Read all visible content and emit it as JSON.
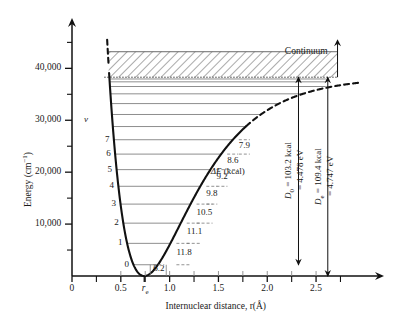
{
  "figure": {
    "type": "morse-potential-energy-curve",
    "background": "#ffffff",
    "curve_color": "#111111",
    "level_color": "#7a7a7a",
    "axis_color": "#111111"
  },
  "axes": {
    "y": {
      "label": "Energy (cm",
      "label_sup": "−1",
      "label_tail": ")",
      "major_ticks": [
        "10,000",
        "20,000",
        "30,000",
        "40,000"
      ],
      "major_values": [
        10000,
        20000,
        30000,
        40000
      ],
      "minor_values": [
        5000,
        15000,
        25000,
        35000,
        45000
      ],
      "min": 0,
      "max": 47000
    },
    "x": {
      "label_pre": "Internuclear distance, r(",
      "label_unit": "Å",
      "label_post": ")",
      "major_ticks": [
        "0",
        "0.5",
        "1.0",
        "1.5",
        "2.0",
        "2.5"
      ],
      "major_values": [
        0,
        0.5,
        1.0,
        1.5,
        2.0,
        2.5
      ],
      "minor_values": [
        0.25,
        0.75,
        1.25,
        1.75,
        2.25,
        2.75
      ],
      "min": 0,
      "max": 2.95,
      "re_label": "r",
      "re_sub": "e",
      "re_value": 0.74
    }
  },
  "annotations": {
    "continuum": "Continuum",
    "delta_e_header_sym": "ΔE",
    "delta_e_header_unit": " (kcal)",
    "v_column_header": "v",
    "d0": {
      "symbol": "D",
      "sub": "0",
      "line1": " = 103.2 kcal",
      "line2": "= 4.478 eV",
      "kcal": 103.2,
      "ev": 4.478,
      "x": 2.32
    },
    "de": {
      "symbol": "D",
      "sub": "e",
      "line1": " = 109.4 kcal",
      "line2": "= 4.747 eV",
      "kcal": 109.4,
      "ev": 4.747,
      "x": 2.62
    }
  },
  "chart_data": {
    "type": "line",
    "title": "",
    "xlabel": "Internuclear distance, r(Å)",
    "ylabel": "Energy (cm−1)",
    "xlim": [
      0,
      2.95
    ],
    "ylim": [
      0,
      47000
    ],
    "grid": false,
    "legend": "none",
    "potential": {
      "model": "morse",
      "De_cm": 38290,
      "re_angstrom": 0.74,
      "a": 1.94,
      "dissociation_limit_cm": 38290,
      "dashed_above_cm": 40500,
      "dashed_right_from_angstrom": 1.78
    },
    "continuum_band": {
      "y_bottom_cm": 38290,
      "y_top_cm": 43200,
      "hatched": true
    },
    "vibrational_levels": [
      {
        "v": "0",
        "energy_cm": 2165,
        "label": "0",
        "delta_e": "6.2"
      },
      {
        "v": "1",
        "energy_cm": 6290,
        "label": "1",
        "delta_e": "11.8"
      },
      {
        "v": "2",
        "energy_cm": 10180,
        "label": "2",
        "delta_e": "11.1"
      },
      {
        "v": "3",
        "energy_cm": 13850,
        "label": "3",
        "delta_e": "10.5"
      },
      {
        "v": "4",
        "energy_cm": 17280,
        "label": "4",
        "delta_e": "9.8"
      },
      {
        "v": "5",
        "energy_cm": 20490,
        "label": "5",
        "delta_e": "9.2"
      },
      {
        "v": "6",
        "energy_cm": 23480,
        "label": "6",
        "delta_e": "8.6"
      },
      {
        "v": "7",
        "energy_cm": 26250,
        "label": "7",
        "delta_e": "7.9"
      },
      {
        "v": "8",
        "energy_cm": 28790,
        "label": "",
        "delta_e": ""
      },
      {
        "v": "9",
        "energy_cm": 31110,
        "label": "",
        "delta_e": ""
      },
      {
        "v": "10",
        "energy_cm": 33210,
        "label": "",
        "delta_e": ""
      },
      {
        "v": "11",
        "energy_cm": 35090,
        "label": "",
        "delta_e": ""
      },
      {
        "v": "12",
        "energy_cm": 36500,
        "label": "",
        "delta_e": ""
      },
      {
        "v": "13",
        "energy_cm": 37400,
        "label": "",
        "delta_e": ""
      },
      {
        "v": "14",
        "energy_cm": 37950,
        "label": "",
        "delta_e": ""
      }
    ],
    "delta_e_values": [
      "7.9",
      "8.6",
      "9.2",
      "9.8",
      "10.5",
      "11.1",
      "11.8",
      "6.2"
    ]
  }
}
